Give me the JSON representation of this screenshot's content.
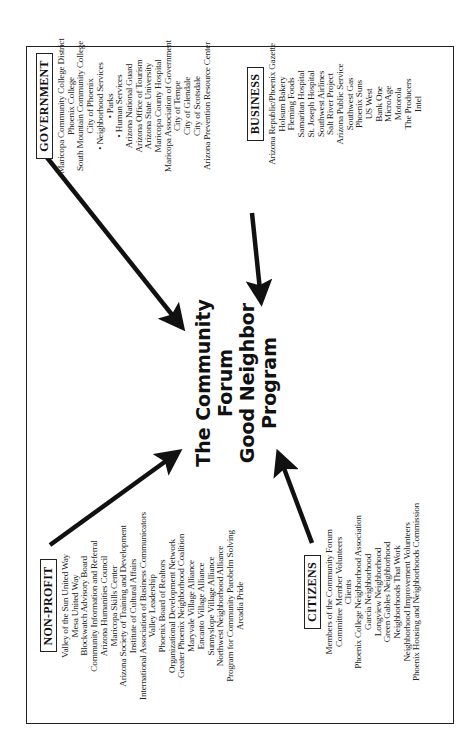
{
  "title": {
    "lines": [
      "The Community",
      "Forum",
      "Good Neighbor",
      "Program"
    ]
  },
  "groups": {
    "government": {
      "label": "GOVERNMENT",
      "items": [
        "Maricopa Community College District",
        "Phoenix College",
        "South Mountain Community College",
        "City of Phoenix",
        "• Neighborhood Services",
        "• Parks",
        "• Human Services",
        "Arizona National Guard",
        "Arizona Office of Tourism",
        "Arizona State University",
        "Maricopa County Hospital",
        "Maricopa Association of Government",
        "City of Tempe",
        "City of Glendale",
        "City of Scotsdale",
        "Arizona Prevention Resource Center"
      ]
    },
    "business": {
      "label": "BUSINESS",
      "items": [
        "Arizona Republic/Phoenix Gazette",
        "Holsum Bakery",
        "Fleming Foods",
        "Samaritan Hospital",
        "St. Joseph Hospital",
        "Southwest Airlines",
        "Salt River Project",
        "Arizona Public Service",
        "Southwest Gas",
        "Phoenix Suns",
        "US West",
        "Bank One",
        "MicroAge",
        "Motorola",
        "The Producers",
        "Intel"
      ]
    },
    "nonprofit": {
      "label": "NON-PROFIT",
      "items": [
        "Valley of the Sun United Way",
        "Mesa United Way",
        "Blockwatch Advisory Board",
        "Community Information and Referral",
        "Arizona Humanities Council",
        "Maricopa Skills Center",
        "Arizona Society of Training and Development",
        "Institute of Cultural Affairs",
        "International Association of Business Communicators",
        "Valley Leadership",
        "Phoenix Board of Realtors",
        "Organizational Development Network",
        "Greater Phoenix Neighborhood Coalition",
        "Maryvale Village Alliance",
        "Encanto Village Alliance",
        "Sunnyslope Village Alliance",
        "Northwest Neighborhood Alliance",
        "Program for Community Parobelm Solving",
        "Arcadia Pride"
      ]
    },
    "citizens": {
      "label": "CITIZENS",
      "items": [
        "Members of the Community Forum",
        "Committee Member Volunteers",
        "Clients",
        "Phoenix College Neighborhood Association",
        "Garcia Neighborhood",
        "Longview Neighborhood",
        "Green Gables Neighborhood",
        "Neighborhoods That Work",
        "Neighborhood Improvement Volunteers",
        "Phoenix Housing and Neighborhoods Commission"
      ]
    }
  },
  "colors": {
    "ink": "#111111",
    "background": "#ffffff"
  }
}
